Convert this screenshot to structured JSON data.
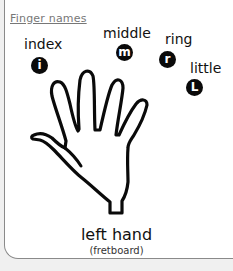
{
  "section_title": "Finger names",
  "fingers": [
    {
      "name": "index",
      "badge": "i"
    },
    {
      "name": "middle",
      "badge": "m"
    },
    {
      "name": "ring",
      "badge": "r"
    },
    {
      "name": "little",
      "badge": "L"
    }
  ],
  "caption": {
    "title": "left hand",
    "subtitle": "(fretboard)"
  },
  "colors": {
    "panel_bg": "#ffffff",
    "page_bg": "#f0f0f0",
    "ink": "#0a0a0a",
    "title_gray": "#777777"
  }
}
